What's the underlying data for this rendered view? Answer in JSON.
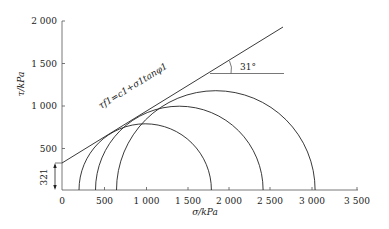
{
  "figure": {
    "x_axis_label": "σ/kPa",
    "y_axis_label": "τ/kPa",
    "x_ticks": [
      "0",
      "500",
      "1 000",
      "1 500",
      "2 000",
      "2 500",
      "3 000",
      "3 500"
    ],
    "y_ticks": [
      "500",
      "1 000",
      "1 500",
      "2 000"
    ],
    "intercept_label": "321",
    "angle_label": "31°",
    "envelope_label": "τf1=c1+σ1tanφ1"
  },
  "geometry": {
    "cohesion_kPa": 321,
    "friction_angle_deg": 31,
    "circles": [
      {
        "left_kPa": 200,
        "right_kPa": 1780
      },
      {
        "left_kPa": 400,
        "right_kPa": 2400
      },
      {
        "left_kPa": 650,
        "right_kPa": 3020
      }
    ]
  }
}
